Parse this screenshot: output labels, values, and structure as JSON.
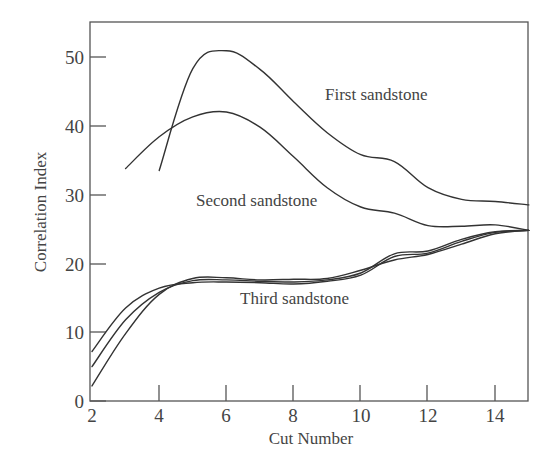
{
  "chart_data": {
    "type": "line",
    "title": "",
    "xlabel": "Cut Number",
    "ylabel": "Correlation Index",
    "xlim": [
      2,
      15
    ],
    "ylim": [
      0,
      55
    ],
    "grid": false,
    "legend": "inline labels",
    "x_ticks": [
      2,
      4,
      6,
      8,
      10,
      12,
      14
    ],
    "y_ticks": [
      0,
      10,
      20,
      30,
      40,
      50
    ],
    "series": [
      {
        "name": "First sandstone",
        "x": [
          4,
          5,
          6,
          7,
          8,
          9,
          10,
          11,
          12,
          13,
          14,
          15
        ],
        "values": [
          33.5,
          48.3,
          50.9,
          48.2,
          43.5,
          39.0,
          35.8,
          34.8,
          31.0,
          29.3,
          29.0,
          28.5
        ]
      },
      {
        "name": "Second sandstone",
        "x": [
          3,
          4,
          5,
          6,
          7,
          8,
          9,
          10,
          11,
          12,
          13,
          14,
          15
        ],
        "values": [
          33.8,
          38.4,
          41.3,
          42.0,
          39.8,
          35.5,
          31.0,
          28.2,
          27.3,
          25.5,
          25.4,
          25.6,
          24.8
        ]
      },
      {
        "name": "Third sandstone",
        "curves": [
          {
            "x": [
              2,
              3,
              4,
              5,
              6,
              7,
              8,
              9,
              10,
              11,
              12,
              13,
              14,
              15
            ],
            "values": [
              7.2,
              13.5,
              16.4,
              17.2,
              17.3,
              17.2,
              17.0,
              17.4,
              18.3,
              21.0,
              21.5,
              23.2,
              24.5,
              24.8
            ]
          },
          {
            "x": [
              2,
              3,
              4,
              5,
              6,
              7,
              8,
              9,
              10,
              11,
              12,
              13,
              14,
              15
            ],
            "values": [
              5.0,
              11.8,
              15.8,
              17.5,
              17.6,
              17.4,
              17.3,
              17.6,
              18.6,
              21.4,
              21.8,
              23.5,
              24.6,
              24.8
            ]
          },
          {
            "x": [
              2,
              3,
              4,
              5,
              6,
              7,
              8,
              9,
              10,
              11,
              12,
              13,
              14,
              15
            ],
            "values": [
              2.2,
              9.8,
              15.5,
              17.8,
              17.9,
              17.6,
              17.7,
              17.8,
              19.0,
              20.5,
              21.3,
              22.8,
              24.3,
              24.8
            ]
          }
        ]
      }
    ],
    "annotations": [
      {
        "text": "First sandstone",
        "x": 9.4,
        "y": 44.5
      },
      {
        "text": "Second sandstone",
        "x": 6.1,
        "y": 29.4
      },
      {
        "text": "Third sandstone",
        "x": 6.8,
        "y": 14.1
      }
    ]
  },
  "labels": {
    "xlabel": "Cut Number",
    "ylabel": "Correlation Index",
    "x_ticks": [
      "2",
      "4",
      "6",
      "8",
      "10",
      "12",
      "14"
    ],
    "y_ticks": [
      "0",
      "10",
      "20",
      "30",
      "40",
      "50"
    ],
    "first": "First sandstone",
    "second": "Second sandstone",
    "third": "Third sandstone"
  }
}
